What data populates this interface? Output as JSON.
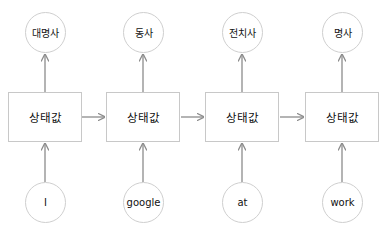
{
  "diagram": {
    "type": "rnn-pos-tagging",
    "colors": {
      "box_border": "#c8c8c8",
      "circle_border": "#cfcfcf",
      "arrow": "#8c8c8c",
      "text": "#111111"
    },
    "columns": [
      {
        "input": "I",
        "state": "상태값",
        "output": "대명사"
      },
      {
        "input": "google",
        "state": "상태값",
        "output": "동사"
      },
      {
        "input": "at",
        "state": "상태값",
        "output": "전치사"
      },
      {
        "input": "work",
        "state": "상태값",
        "output": "명사"
      }
    ]
  }
}
